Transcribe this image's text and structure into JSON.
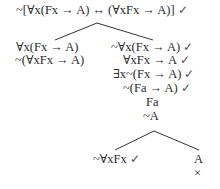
{
  "tree": {
    "root": {
      "formula": "~[∀x(Fx → A) ↔ (∀xFx → A)]",
      "checked": "✓"
    },
    "left_branch": [
      {
        "formula": "∀x(Fx → A)",
        "checked": ""
      },
      {
        "formula": "~(∀xFx → A)",
        "checked": ""
      }
    ],
    "right_branch": [
      {
        "formula": "~∀x(Fx → A)",
        "checked": "✓"
      },
      {
        "formula": "∀xFx → A",
        "checked": "✓"
      },
      {
        "formula": "∃x~(Fx → A)",
        "checked": "✓"
      },
      {
        "formula": "~(Fa → A)",
        "checked": "✓"
      },
      {
        "formula": "Fa",
        "checked": ""
      },
      {
        "formula": "~A",
        "checked": ""
      }
    ],
    "sub_left": {
      "formula": "~∀xFx",
      "checked": "✓"
    },
    "sub_right": {
      "formula": "A",
      "closed": "×"
    }
  },
  "colors": {
    "text": "#2a2a2a",
    "lines": "#333333"
  }
}
